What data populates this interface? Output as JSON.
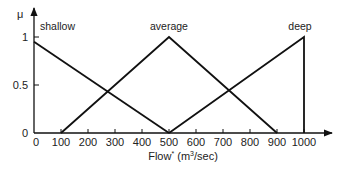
{
  "chart_data": {
    "type": "line",
    "title": "",
    "xlabel": "Flow* (m3/sec)",
    "xlabel_parts": {
      "main": "Flow",
      "star": "*",
      "open": " (m",
      "sup": "3",
      "close": "/sec)"
    },
    "ylabel": "μ",
    "xlim": [
      0,
      1000
    ],
    "ylim": [
      0,
      1
    ],
    "x_ticks": [
      0,
      100,
      200,
      300,
      400,
      500,
      600,
      700,
      800,
      900,
      1000
    ],
    "x_tick_labels": [
      "0",
      "100",
      "200",
      "300",
      "400",
      "500",
      "600",
      "700",
      "800",
      "900",
      "1000"
    ],
    "y_ticks": [
      0,
      0.5,
      1
    ],
    "y_tick_labels": [
      "0",
      "0.5",
      "1"
    ],
    "grid": false,
    "legend": "inline labels above each membership function",
    "series": [
      {
        "name": "shallow",
        "x": [
          0,
          500
        ],
        "y": [
          0.95,
          0
        ]
      },
      {
        "name": "average",
        "x": [
          100,
          500,
          900
        ],
        "y": [
          0,
          1,
          0
        ]
      },
      {
        "name": "deep",
        "x": [
          500,
          1000,
          1000
        ],
        "y": [
          0,
          1,
          0
        ]
      }
    ],
    "line_color": "#111111"
  }
}
